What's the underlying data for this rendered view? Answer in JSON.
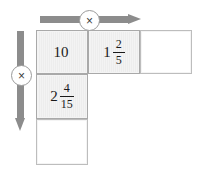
{
  "diagram": {
    "operators": {
      "horizontal": {
        "symbol": "×",
        "icon": "multiply-icon",
        "direction": "right"
      },
      "vertical": {
        "symbol": "×",
        "icon": "multiply-icon",
        "direction": "down"
      }
    },
    "cells": {
      "r1c1": {
        "filled": true,
        "whole": "10",
        "numerator": "",
        "denominator": ""
      },
      "r1c2": {
        "filled": true,
        "whole": "1",
        "numerator": "2",
        "denominator": "5"
      },
      "r1c3": {
        "filled": false,
        "whole": "",
        "numerator": "",
        "denominator": ""
      },
      "r2c1": {
        "filled": true,
        "whole": "2",
        "numerator": "4",
        "denominator": "15"
      },
      "r3c1": {
        "filled": false,
        "whole": "",
        "numerator": "",
        "denominator": ""
      }
    }
  },
  "colors": {
    "arrow": "#8c8c8c",
    "cell_border": "#b4b4b4",
    "cell_fill": "#efefef",
    "text": "#1a1a1a",
    "background": "#ffffff"
  }
}
